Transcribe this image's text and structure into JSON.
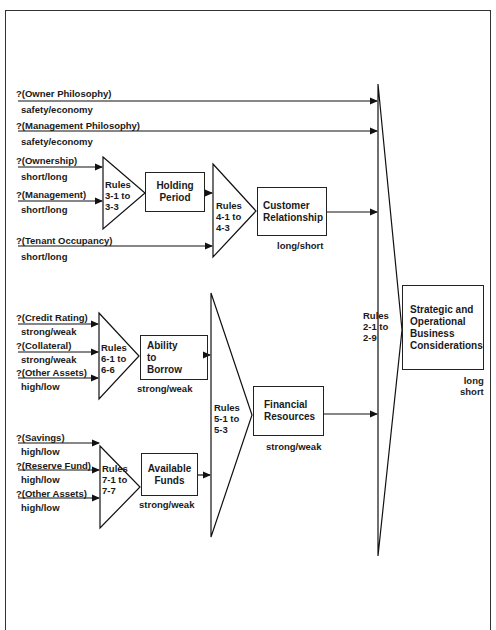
{
  "header": {
    "title_cut": "Figure ... Expert System Rule Structure (Prototype)"
  },
  "inputs": {
    "owner_philosophy": {
      "label": "?(Owner Philosophy)",
      "values": "safety/economy"
    },
    "management_philosophy": {
      "label": "?(Management Philosophy)",
      "values": "safety/economy"
    },
    "ownership": {
      "label": "?(Ownership)",
      "values": "short/long"
    },
    "management": {
      "label": "?(Management)",
      "values": "short/long"
    },
    "tenant_occupancy": {
      "label": "?(Tenant Occupancy)",
      "values": "short/long"
    },
    "credit_rating": {
      "label": "?(Credit Rating)",
      "values": "strong/weak"
    },
    "collateral": {
      "label": "?(Collateral)",
      "values": "strong/weak"
    },
    "other_assets_1": {
      "label": "?(Other Assets)",
      "values": "high/low"
    },
    "savings": {
      "label": "?(Savings)",
      "values": "high/low"
    },
    "reserve_fund": {
      "label": "?(Reserve Fund)",
      "values": "high/low"
    },
    "other_assets_2": {
      "label": "?(Other Assets)",
      "values": "high/low"
    }
  },
  "rules": {
    "r3": [
      "Rules",
      "3-1 to",
      "3-3"
    ],
    "r4": [
      "Rules",
      "4-1 to",
      "4-3"
    ],
    "r6": [
      "Rules",
      "6-1 to",
      "6-6"
    ],
    "r7": [
      "Rules",
      "7-1 to",
      "7-7"
    ],
    "r5": [
      "Rules",
      "5-1 to",
      "5-3"
    ],
    "r2": [
      "Rules",
      "2-1 to",
      "2-9"
    ]
  },
  "nodes": {
    "holding_period": {
      "lines": [
        "Holding",
        "Period"
      ]
    },
    "customer_relationship": {
      "lines": [
        "Customer",
        "Relationship"
      ],
      "values": "long/short"
    },
    "ability_to_borrow": {
      "lines": [
        "Ability",
        "to",
        "Borrow"
      ],
      "values": "strong/weak"
    },
    "available_funds": {
      "lines": [
        "Available",
        "Funds"
      ],
      "values": "strong/weak"
    },
    "financial_resources": {
      "lines": [
        "Financial",
        "Resources"
      ],
      "values": "strong/weak"
    },
    "strategic": {
      "lines": [
        "Strategic and",
        "Operational",
        "Business",
        "Considerations"
      ],
      "values": [
        "long",
        "short"
      ]
    }
  }
}
